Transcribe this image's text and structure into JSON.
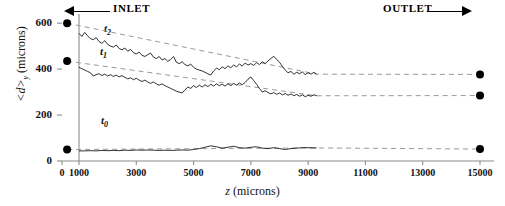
{
  "annotations": {
    "inlet": "INLET",
    "outlet": "OUTLET"
  },
  "axes": {
    "y_title_main": "<d>",
    "y_title_sub": "y",
    "y_title_unit": " (microns)",
    "x_title_main": "z",
    "x_title_unit": " (microns)"
  },
  "curve_labels": {
    "t2": "t2",
    "t1": "t1",
    "t0": "t0"
  },
  "colors": {
    "curve": "#1a1a1a",
    "dashed": "#9a9a9a",
    "marker": "#000000",
    "axis": "#8c8c8c"
  },
  "chart_data": {
    "type": "line",
    "title": "",
    "xlabel": "z (microns)",
    "ylabel": "<d>y (microns)",
    "xlim": [
      0,
      15400
    ],
    "ylim": [
      0,
      640
    ],
    "grid": false,
    "legend": "inline-curve-labels",
    "xticks": [
      0,
      1000,
      3000,
      5000,
      7000,
      9000,
      11000,
      13000,
      15000
    ],
    "xticklabels": [
      "0",
      "1000",
      "3000",
      "5000",
      "7000",
      "9000",
      "11000",
      "13000",
      "15000"
    ],
    "yticks": [
      0,
      200,
      400,
      600
    ],
    "yticklabels": [
      "0",
      "200",
      "400",
      "600"
    ],
    "inlet_marker_line_z": 1000,
    "series": [
      {
        "name": "t2",
        "label": "t2",
        "style": "solid-noisy",
        "start_marker": {
          "z": 300,
          "d": 600
        },
        "end_marker": {
          "z": 15000,
          "d": 377
        },
        "data_start_z": 1000,
        "data_end_z": 9300,
        "x": [
          1000,
          1100,
          1200,
          1300,
          1400,
          1500,
          1600,
          1700,
          1800,
          1900,
          2000,
          2100,
          2200,
          2300,
          2400,
          2500,
          2600,
          2700,
          2800,
          2900,
          3000,
          3100,
          3200,
          3300,
          3400,
          3500,
          3600,
          3700,
          3800,
          3900,
          4000,
          4100,
          4200,
          4300,
          4400,
          4500,
          4600,
          4700,
          4800,
          4900,
          5000,
          5100,
          5200,
          5300,
          5400,
          5500,
          5600,
          5700,
          5800,
          5900,
          6000,
          6100,
          6200,
          6300,
          6400,
          6500,
          6600,
          6700,
          6800,
          6900,
          7000,
          7100,
          7200,
          7300,
          7400,
          7500,
          7600,
          7700,
          7800,
          7900,
          8000,
          8100,
          8200,
          8300,
          8400,
          8500,
          8600,
          8700,
          8800,
          8900,
          9000,
          9100,
          9200,
          9300
        ],
        "values": [
          556,
          542,
          560,
          545,
          533,
          528,
          537,
          520,
          512,
          524,
          508,
          500,
          496,
          505,
          490,
          484,
          492,
          478,
          486,
          472,
          466,
          474,
          460,
          455,
          463,
          470,
          452,
          446,
          455,
          440,
          446,
          434,
          442,
          455,
          430,
          424,
          432,
          420,
          414,
          422,
          408,
          400,
          396,
          392,
          386,
          380,
          374,
          392,
          404,
          398,
          410,
          402,
          414,
          406,
          418,
          410,
          422,
          414,
          426,
          418,
          424,
          416,
          428,
          420,
          432,
          424,
          436,
          446,
          456,
          442,
          430,
          412,
          396,
          384,
          390,
          378,
          386,
          380,
          388,
          376,
          384,
          378,
          386,
          378
        ]
      },
      {
        "name": "t1",
        "label": "t1",
        "style": "solid-noisy",
        "start_marker": {
          "z": 300,
          "d": 435
        },
        "end_marker": {
          "z": 15000,
          "d": 285
        },
        "data_start_z": 1000,
        "data_end_z": 9300,
        "x": [
          1000,
          1100,
          1200,
          1300,
          1400,
          1500,
          1600,
          1700,
          1800,
          1900,
          2000,
          2100,
          2200,
          2300,
          2400,
          2500,
          2600,
          2700,
          2800,
          2900,
          3000,
          3100,
          3200,
          3300,
          3400,
          3500,
          3600,
          3700,
          3800,
          3900,
          4000,
          4100,
          4200,
          4300,
          4400,
          4500,
          4600,
          4700,
          4800,
          4900,
          5000,
          5100,
          5200,
          5300,
          5400,
          5500,
          5600,
          5700,
          5800,
          5900,
          6000,
          6100,
          6200,
          6300,
          6400,
          6500,
          6600,
          6700,
          6800,
          6900,
          7000,
          7100,
          7200,
          7300,
          7400,
          7500,
          7600,
          7700,
          7800,
          7900,
          8000,
          8100,
          8200,
          8300,
          8400,
          8500,
          8600,
          8700,
          8800,
          8900,
          9000,
          9100,
          9200,
          9300
        ],
        "values": [
          408,
          402,
          396,
          390,
          384,
          370,
          376,
          380,
          372,
          378,
          370,
          376,
          368,
          374,
          366,
          372,
          364,
          358,
          362,
          354,
          360,
          352,
          346,
          352,
          344,
          338,
          344,
          336,
          330,
          336,
          328,
          322,
          316,
          310,
          304,
          300,
          296,
          310,
          322,
          316,
          328,
          320,
          330,
          322,
          332,
          324,
          334,
          326,
          336,
          328,
          334,
          326,
          336,
          328,
          338,
          330,
          340,
          332,
          342,
          356,
          366,
          350,
          334,
          316,
          300,
          306,
          298,
          292,
          298,
          290,
          296,
          288,
          294,
          286,
          292,
          284,
          290,
          282,
          288,
          280,
          286,
          282,
          288,
          284
        ]
      },
      {
        "name": "t0",
        "label": "t0",
        "style": "solid-flat",
        "start_marker": {
          "z": 300,
          "d": 50
        },
        "end_marker": {
          "z": 15000,
          "d": 52
        },
        "data_start_z": 1000,
        "data_end_z": 9300,
        "x": [
          1000,
          1200,
          1400,
          1600,
          1800,
          2000,
          2200,
          2400,
          2600,
          2800,
          3000,
          3200,
          3400,
          3600,
          3800,
          4000,
          4200,
          4400,
          4600,
          4800,
          5000,
          5200,
          5400,
          5600,
          5800,
          6000,
          6200,
          6400,
          6600,
          6800,
          7000,
          7200,
          7400,
          7600,
          7800,
          8000,
          8200,
          8400,
          8600,
          8800,
          9000,
          9200,
          9300
        ],
        "values": [
          44,
          44,
          45,
          44,
          46,
          45,
          46,
          45,
          47,
          46,
          48,
          47,
          48,
          47,
          46,
          47,
          46,
          47,
          48,
          47,
          50,
          54,
          60,
          66,
          62,
          56,
          60,
          64,
          58,
          56,
          60,
          62,
          56,
          54,
          58,
          54,
          50,
          54,
          56,
          58,
          58,
          57,
          57
        ]
      }
    ]
  }
}
